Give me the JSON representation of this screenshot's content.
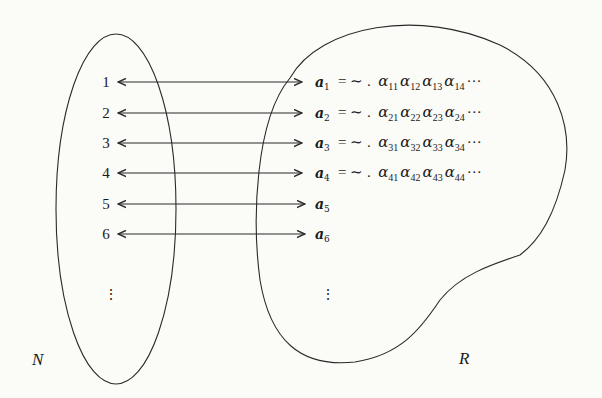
{
  "diagram": {
    "sets": {
      "left_label": "N",
      "right_label": "R"
    },
    "rows": [
      {
        "n": "1",
        "vec": "a",
        "sub": "1",
        "eq": "= ∼ .",
        "terms": [
          [
            "α",
            "11"
          ],
          [
            "α",
            "12"
          ],
          [
            "α",
            "13"
          ],
          [
            "α",
            "14"
          ]
        ],
        "ellipsis": "···"
      },
      {
        "n": "2",
        "vec": "a",
        "sub": "2",
        "eq": "= ∼ .",
        "terms": [
          [
            "α",
            "21"
          ],
          [
            "α",
            "22"
          ],
          [
            "α",
            "23"
          ],
          [
            "α",
            "24"
          ]
        ],
        "ellipsis": "···"
      },
      {
        "n": "3",
        "vec": "a",
        "sub": "3",
        "eq": "= ∼ .",
        "terms": [
          [
            "α",
            "31"
          ],
          [
            "α",
            "32"
          ],
          [
            "α",
            "33"
          ],
          [
            "α",
            "34"
          ]
        ],
        "ellipsis": "···"
      },
      {
        "n": "4",
        "vec": "a",
        "sub": "4",
        "eq": "= ∼ .",
        "terms": [
          [
            "α",
            "41"
          ],
          [
            "α",
            "42"
          ],
          [
            "α",
            "43"
          ],
          [
            "α",
            "44"
          ]
        ],
        "ellipsis": "···"
      },
      {
        "n": "5",
        "vec": "a",
        "sub": "5"
      },
      {
        "n": "6",
        "vec": "a",
        "sub": "6"
      }
    ],
    "continuation": "⋮",
    "arrow": "bidirectional",
    "stroke_color": "#2a2a2a",
    "background": "#fbfbf8"
  }
}
